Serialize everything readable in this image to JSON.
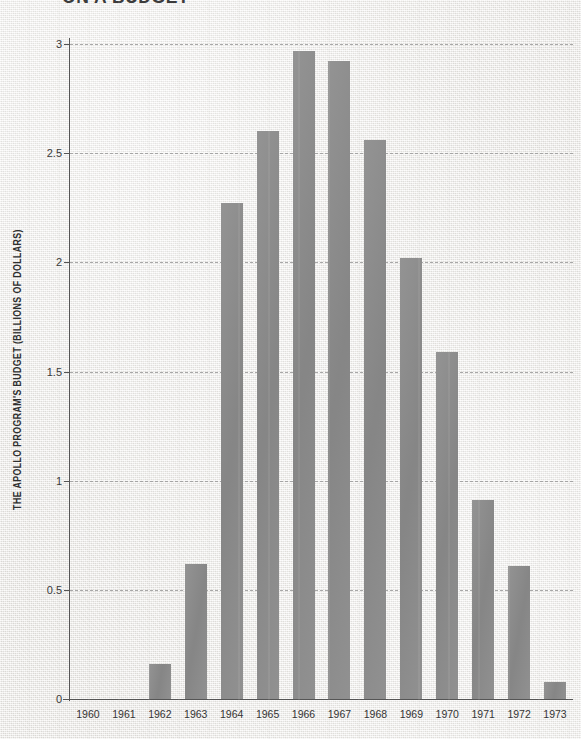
{
  "headline": {
    "text": "ON A BUDGET",
    "note": "cut off at top edge of screenshot"
  },
  "axes": {
    "y_title": "THE APOLLO PROGRAM'S BUDGET (BILLIONS OF DOLLARS)",
    "x_title": ""
  },
  "colors": {
    "bar": "#8b8b8b",
    "axis": "#555555",
    "grid": "#9a9a9a",
    "background": "#ebe9e5",
    "text": "#333333"
  },
  "chart_data": {
    "type": "bar",
    "title": "ON A BUDGET",
    "xlabel": "",
    "ylabel": "THE APOLLO PROGRAM'S BUDGET (BILLIONS OF DOLLARS)",
    "categories": [
      "1960",
      "1961",
      "1962",
      "1963",
      "1964",
      "1965",
      "1966",
      "1967",
      "1968",
      "1969",
      "1970",
      "1971",
      "1972",
      "1973"
    ],
    "values": [
      0,
      0,
      0.16,
      0.62,
      2.27,
      2.6,
      2.97,
      2.92,
      2.56,
      2.02,
      1.59,
      0.91,
      0.61,
      0.08
    ],
    "ylim": [
      0,
      3
    ],
    "yticks": [
      0,
      0.5,
      1,
      1.5,
      2,
      2.5,
      3
    ],
    "ytick_labels": [
      "0",
      "0.5",
      "1",
      "1.5",
      "2",
      "2.5",
      "3"
    ],
    "grid": "horizontal-dashed",
    "legend": "none",
    "series": [
      {
        "name": "Apollo program budget",
        "unit": "billions of dollars",
        "values": [
          0,
          0,
          0.16,
          0.62,
          2.27,
          2.6,
          2.97,
          2.92,
          2.56,
          2.02,
          1.59,
          0.91,
          0.61,
          0.08
        ]
      }
    ]
  }
}
